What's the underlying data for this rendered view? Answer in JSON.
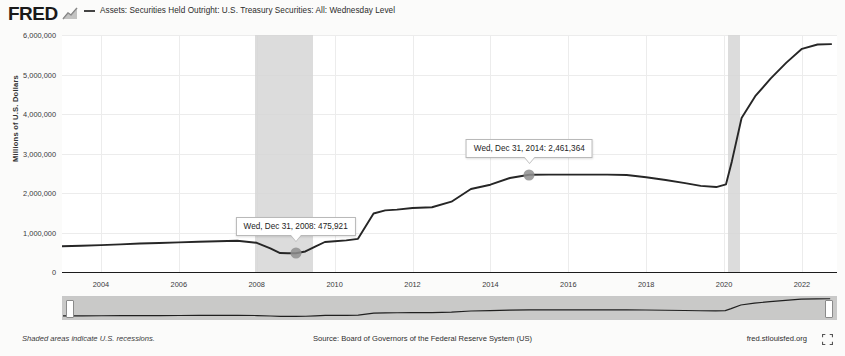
{
  "brand": {
    "logo_text": "FRED",
    "logo_mark_icon": "fred-chart-mark-icon"
  },
  "legend": {
    "series_label": "Assets: Securities Held Outright: U.S. Treasury Securities: All: Wednesday Level",
    "swatch_color": "#444444"
  },
  "footer": {
    "recession_note": "Shaded areas indicate U.S. recessions.",
    "source": "Source: Board of Governors of the Federal Reserve System (US)",
    "url": "fred.stlouisfed.org",
    "expand_icon": "fullscreen-expand-icon"
  },
  "range_selector": {
    "left_handle_icon": "range-handle-left-icon",
    "right_handle_icon": "range-handle-right-icon"
  },
  "chart_data": {
    "type": "line",
    "title": "Assets: Securities Held Outright: U.S. Treasury Securities: All: Wednesday Level",
    "xlabel": "",
    "ylabel": "Millions of U.S. Dollars",
    "xlim": [
      2003.0,
      2022.9
    ],
    "ylim": [
      0,
      6000000
    ],
    "ytick_labels": [
      "6,000,000",
      "5,000,000",
      "4,000,000",
      "3,000,000",
      "2,000,000",
      "1,000,000",
      "0"
    ],
    "ytick_values": [
      6000000,
      5000000,
      4000000,
      3000000,
      2000000,
      1000000,
      0
    ],
    "xtick_labels": [
      "2004",
      "2006",
      "2008",
      "2010",
      "2012",
      "2014",
      "2016",
      "2018",
      "2020",
      "2022"
    ],
    "xtick_values": [
      2004,
      2006,
      2008,
      2010,
      2012,
      2014,
      2016,
      2018,
      2020,
      2022
    ],
    "grid": true,
    "legend_position": "top",
    "line_color": "#262626",
    "series": [
      {
        "name": "Assets: Securities Held Outright: U.S. Treasury Securities: All: Wednesday Level",
        "x": [
          2003.0,
          2003.5,
          2004.0,
          2004.5,
          2005.0,
          2005.5,
          2006.0,
          2006.5,
          2007.0,
          2007.5,
          2008.0,
          2008.35,
          2008.6,
          2008.8,
          2009.0,
          2009.25,
          2009.5,
          2009.75,
          2010.0,
          2010.3,
          2010.6,
          2011.0,
          2011.3,
          2011.6,
          2012.0,
          2012.5,
          2013.0,
          2013.5,
          2014.0,
          2014.5,
          2015.0,
          2015.5,
          2016.0,
          2016.5,
          2017.0,
          2017.5,
          2018.0,
          2018.5,
          2019.0,
          2019.4,
          2019.8,
          2020.05,
          2020.2,
          2020.45,
          2020.8,
          2021.2,
          2021.6,
          2022.0,
          2022.4,
          2022.75
        ],
        "y": [
          650000,
          665000,
          680000,
          700000,
          720000,
          735000,
          750000,
          765000,
          780000,
          790000,
          740000,
          600000,
          480000,
          476000,
          475921,
          520000,
          640000,
          760000,
          780000,
          800000,
          840000,
          1480000,
          1560000,
          1580000,
          1620000,
          1640000,
          1780000,
          2100000,
          2210000,
          2380000,
          2461364,
          2465000,
          2465000,
          2465000,
          2465000,
          2455000,
          2400000,
          2330000,
          2250000,
          2180000,
          2150000,
          2220000,
          2800000,
          3900000,
          4450000,
          4900000,
          5300000,
          5650000,
          5760000,
          5770000
        ]
      }
    ],
    "annotations": [
      {
        "label": "Wed, Dec 31, 2008: 475,921",
        "x": 2009.0,
        "y": 475921,
        "date": "Wed, Dec 31, 2008",
        "value": "475,921"
      },
      {
        "label": "Wed, Dec 31, 2014: 2,461,364",
        "x": 2015.0,
        "y": 2461364,
        "date": "Wed, Dec 31, 2014",
        "value": "2,461,364"
      }
    ],
    "recession_bands": [
      {
        "start": 2007.95,
        "end": 2009.45,
        "color": "#d6d6d6"
      },
      {
        "start": 2020.1,
        "end": 2020.4,
        "color": "#d6d6d6"
      }
    ]
  }
}
